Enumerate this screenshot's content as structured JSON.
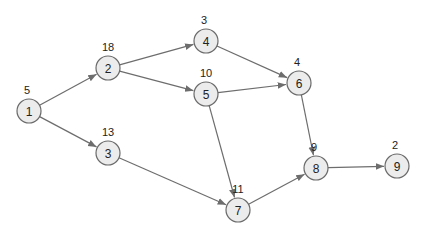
{
  "diagram": {
    "type": "directed-graph",
    "colors": {
      "node_fill": "#ececec",
      "node_stroke": "#6a6a6a",
      "edge": "#6d6d6d",
      "text": "#222222"
    },
    "nodes": [
      {
        "id": "1",
        "weight": "5",
        "x": 29,
        "y": 111
      },
      {
        "id": "2",
        "weight": "18",
        "x": 108,
        "y": 68
      },
      {
        "id": "3",
        "weight": "13",
        "x": 108,
        "y": 153
      },
      {
        "id": "4",
        "weight": "3",
        "x": 206,
        "y": 41
      },
      {
        "id": "5",
        "weight": "10",
        "x": 206,
        "y": 94
      },
      {
        "id": "6",
        "weight": "4",
        "x": 299,
        "y": 83
      },
      {
        "id": "7",
        "weight": "11",
        "x": 238,
        "y": 210
      },
      {
        "id": "8",
        "weight": "9",
        "x": 316,
        "y": 168
      },
      {
        "id": "9",
        "weight": "2",
        "x": 397,
        "y": 166
      }
    ],
    "edges": [
      {
        "from": "1",
        "to": "2"
      },
      {
        "from": "1",
        "to": "3"
      },
      {
        "from": "2",
        "to": "4"
      },
      {
        "from": "2",
        "to": "5"
      },
      {
        "from": "3",
        "to": "7"
      },
      {
        "from": "4",
        "to": "6"
      },
      {
        "from": "5",
        "to": "6"
      },
      {
        "from": "5",
        "to": "7"
      },
      {
        "from": "6",
        "to": "8"
      },
      {
        "from": "7",
        "to": "8"
      },
      {
        "from": "8",
        "to": "9"
      }
    ]
  }
}
